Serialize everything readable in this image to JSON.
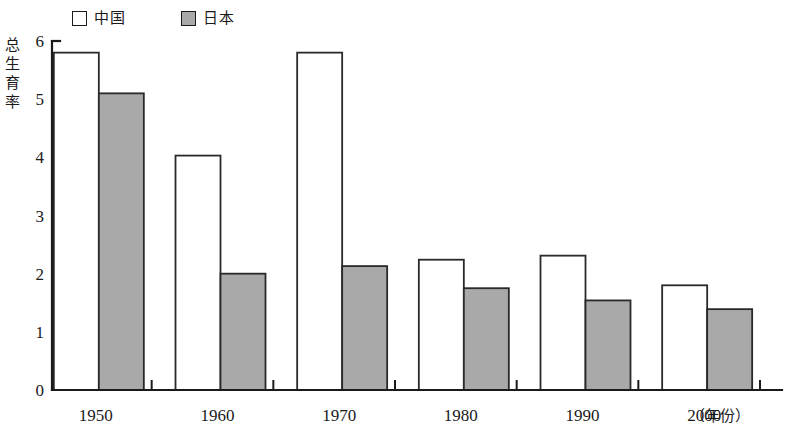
{
  "chart_data": {
    "type": "bar",
    "title": "",
    "subtitle": "",
    "xlabel": "（年份）",
    "ylabel": "总生育率",
    "categories": [
      "1950",
      "1960",
      "1970",
      "1980",
      "1990",
      "2000"
    ],
    "series": [
      {
        "name": "中国",
        "values": [
          5.8,
          4.03,
          5.8,
          2.24,
          2.31,
          1.8
        ],
        "color": "#ffffff"
      },
      {
        "name": "日本",
        "values": [
          5.1,
          2.0,
          2.13,
          1.75,
          1.54,
          1.39
        ],
        "color": "#a9a9a9"
      }
    ],
    "ylim": [
      0,
      6
    ],
    "ytick_labels": [
      "0",
      "1",
      "2",
      "3",
      "4",
      "5",
      "6"
    ],
    "ytick_values": [
      0,
      1,
      2,
      3,
      4,
      5,
      6
    ],
    "grid": false,
    "legend_position": "top-left",
    "legend_entries": [
      {
        "label": "中国",
        "swatch": "white-square"
      },
      {
        "label": "日本",
        "swatch": "gray-square"
      }
    ]
  },
  "axis": {
    "y_title": "总生育率",
    "x_unit_label": "（年份）"
  },
  "legend": {
    "china_label": "中国",
    "japan_label": "日本"
  }
}
